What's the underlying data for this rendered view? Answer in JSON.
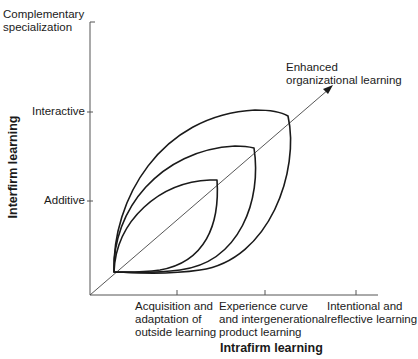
{
  "diagram": {
    "y_axis": {
      "title": "Interfirm learning",
      "ticks": [
        {
          "label_lines": [
            "Complementary",
            "specialization"
          ]
        },
        {
          "label_lines": [
            "Interactive"
          ]
        },
        {
          "label_lines": [
            "Additive"
          ]
        }
      ]
    },
    "x_axis": {
      "title": "Intrafirm learning",
      "ticks": [
        {
          "label_lines": [
            "Acquisition and",
            "adaptation of",
            "outside learning"
          ]
        },
        {
          "label_lines": [
            "Experience curve",
            "and intergenerational",
            "product learning"
          ]
        },
        {
          "label_lines": [
            "Intentional and",
            "reflective learning"
          ]
        }
      ]
    },
    "diagonal_arrow": {
      "label_lines": [
        "Enhanced",
        "organizational learning"
      ]
    },
    "lenses": [
      {
        "name": "small",
        "level": "Additive / Acquisition and adaptation of outside learning"
      },
      {
        "name": "medium",
        "level": "Interactive / Experience curve and intergenerational product learning"
      },
      {
        "name": "large",
        "level": "Complementary specialization / Intentional and reflective learning"
      }
    ],
    "colors": {
      "ink": "#1a1a1a",
      "axis": "#555555",
      "background": "#ffffff"
    }
  }
}
